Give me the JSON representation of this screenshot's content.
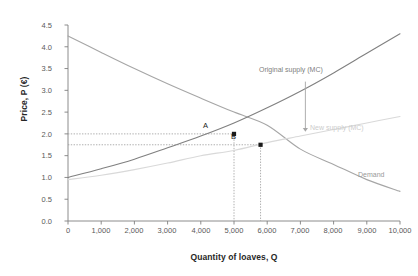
{
  "chart_data": {
    "type": "line",
    "title": "",
    "xlabel": "Quantity of loaves, Q",
    "ylabel": "Price, P (€)",
    "xlim": [
      0,
      10000
    ],
    "ylim": [
      0.0,
      4.5
    ],
    "grid": false,
    "legend_position": "inline-annotations",
    "xticks": [
      "0",
      "1,000",
      "2,000",
      "3,000",
      "4,000",
      "5,000",
      "6,000",
      "7,000",
      "8,000",
      "9,000",
      "10,000"
    ],
    "xtick_values": [
      0,
      1000,
      2000,
      3000,
      4000,
      5000,
      6000,
      7000,
      8000,
      9000,
      10000
    ],
    "yticks": [
      "0.0",
      "0.5",
      "1.0",
      "1.5",
      "2.0",
      "2.5",
      "3.0",
      "3.5",
      "4.0",
      "4.5"
    ],
    "ytick_values": [
      0.0,
      0.5,
      1.0,
      1.5,
      2.0,
      2.5,
      3.0,
      3.5,
      4.0,
      4.5
    ],
    "series": [
      {
        "name": "Demand",
        "color": "#a6a6a6",
        "x": [
          0,
          1000,
          2000,
          3000,
          4000,
          5000,
          6000,
          7000,
          8000,
          9000,
          10000
        ],
        "values": [
          4.25,
          3.87,
          3.5,
          3.15,
          2.82,
          2.5,
          2.2,
          1.65,
          1.3,
          0.95,
          0.68
        ]
      },
      {
        "name": "Original supply (MC)",
        "color": "#808080",
        "x": [
          0,
          1000,
          2000,
          3000,
          4000,
          5000,
          6000,
          7000,
          8000,
          9000,
          10000
        ],
        "values": [
          1.0,
          1.2,
          1.42,
          1.68,
          1.95,
          2.25,
          2.6,
          2.98,
          3.4,
          3.85,
          4.3
        ]
      },
      {
        "name": "New supply (MC)",
        "color": "#d9d9d9",
        "x": [
          0,
          1000,
          2000,
          3000,
          4000,
          5000,
          6000,
          7000,
          8000,
          9000,
          10000
        ],
        "values": [
          0.95,
          1.05,
          1.18,
          1.33,
          1.5,
          1.62,
          1.8,
          1.95,
          2.1,
          2.25,
          2.4
        ]
      }
    ],
    "points": [
      {
        "label": "A",
        "x": 5000,
        "y": 2.0
      },
      {
        "label": "B",
        "x": 5800,
        "y": 1.75
      }
    ],
    "annotations": [
      {
        "text": "Original supply (MC)",
        "x": 6250,
        "y": 3.05
      },
      {
        "text": "New supply (MC)",
        "x": 7500,
        "y": 2.12
      },
      {
        "text": "Demand",
        "x": 8800,
        "y": 1.32
      },
      {
        "text": "shift-arrow",
        "x": 7150,
        "y": 2.6
      }
    ]
  },
  "axes": {
    "y_title": "Price, P (€)",
    "x_title": "Quantity of loaves, Q",
    "y_labels": [
      "4.5",
      "4.0",
      "3.5",
      "3.0",
      "2.5",
      "2.0",
      "1.5",
      "1.0",
      "0.5",
      "0.0"
    ],
    "x_labels": [
      "0",
      "1,000",
      "2,000",
      "3,000",
      "4,000",
      "5,000",
      "6,000",
      "7,000",
      "8,000",
      "9,000",
      "10,000"
    ]
  },
  "labels": {
    "original_supply": "Original supply (MC)",
    "new_supply": "New supply (MC)",
    "demand": "Demand",
    "point_a": "A",
    "point_b": "B"
  },
  "colors": {
    "demand": "#a6a6a6",
    "original_supply": "#808080",
    "new_supply": "#d9d9d9",
    "axis": "#808080",
    "text": "#595959",
    "marker": "#1a1a1a"
  }
}
